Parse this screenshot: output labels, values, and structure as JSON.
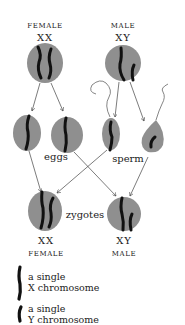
{
  "colors": {
    "cell": "#8f8f8f",
    "chromosome": "#111111",
    "line": "#444444",
    "background": "#ffffff"
  },
  "parents": {
    "female": {
      "sex_label": "FEMALE",
      "genotype": "XX"
    },
    "male": {
      "sex_label": "MALE",
      "genotype": "XY"
    }
  },
  "gametes": {
    "eggs_label": "eggs",
    "sperm_label": "sperm"
  },
  "zygotes": {
    "label": "zygotes",
    "female": {
      "genotype": "XX",
      "sex_label": "FEMALE"
    },
    "male": {
      "genotype": "XY",
      "sex_label": "MALE"
    }
  },
  "legend": {
    "x": {
      "line1": "a single",
      "line2": "X chromosome"
    },
    "y": {
      "line1": "a single",
      "line2": "Y chromosome"
    }
  }
}
